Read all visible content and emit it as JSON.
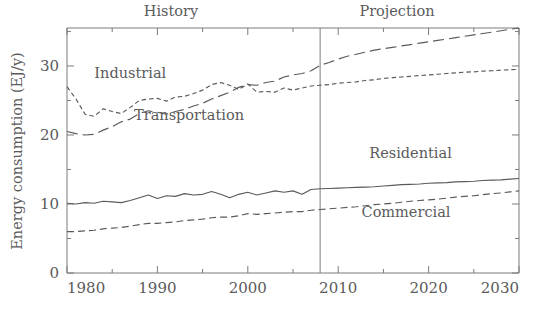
{
  "chart_data": {
    "type": "line",
    "title": "",
    "xlabel": "",
    "ylabel": "Energy consumption (EJ/y)",
    "xlim": [
      1980,
      2030
    ],
    "ylim": [
      0,
      35.5
    ],
    "grid": false,
    "legend_position": "inline-annotations",
    "x_ticks": [
      "1980",
      "1990",
      "2000",
      "2010",
      "2020",
      "2030"
    ],
    "x_tick_values": [
      1980,
      1990,
      2000,
      2010,
      2020,
      2030
    ],
    "x_minor_tick_values": [
      1985,
      1995,
      2005,
      2015,
      2025
    ],
    "y_ticks": [
      "0",
      "10",
      "20",
      "30"
    ],
    "y_tick_values": [
      0,
      10,
      20,
      30
    ],
    "y_minor_tick_values": [
      5,
      15,
      25,
      35
    ],
    "annotations": [
      {
        "text": "History",
        "x": 1991.5,
        "y": 37.3
      },
      {
        "text": "Projection",
        "x": 2016.5,
        "y": 37.3
      },
      {
        "text": "Industrial",
        "x": 1987.0,
        "y": 28.2
      },
      {
        "text": "Transportation",
        "x": 1993.5,
        "y": 22.2
      },
      {
        "text": "Residential",
        "x": 2018.0,
        "y": 16.6
      },
      {
        "text": "Commercial",
        "x": 2017.5,
        "y": 8.1
      }
    ],
    "divider": {
      "label": "history-projection-divider",
      "x": 2008
    },
    "x": [
      1980,
      1981,
      1982,
      1983,
      1984,
      1985,
      1986,
      1987,
      1988,
      1989,
      1990,
      1991,
      1992,
      1993,
      1994,
      1995,
      1996,
      1997,
      1998,
      1999,
      2000,
      2001,
      2002,
      2003,
      2004,
      2005,
      2006,
      2007,
      2008,
      2009,
      2010,
      2011,
      2012,
      2013,
      2014,
      2015,
      2016,
      2017,
      2018,
      2019,
      2020,
      2021,
      2022,
      2023,
      2024,
      2025,
      2026,
      2027,
      2028,
      2029,
      2030
    ],
    "series": [
      {
        "name": "Industrial",
        "line_style": "short-dash",
        "values": [
          27.0,
          25.2,
          23.0,
          22.7,
          23.8,
          23.4,
          23.1,
          24.0,
          25.0,
          25.2,
          25.3,
          24.9,
          25.5,
          25.6,
          26.0,
          26.5,
          27.3,
          27.6,
          27.2,
          26.6,
          27.4,
          26.2,
          26.3,
          26.2,
          26.8,
          26.5,
          26.8,
          27.1,
          27.2,
          27.3,
          27.5,
          27.6,
          27.7,
          27.9,
          28.0,
          28.2,
          28.3,
          28.4,
          28.5,
          28.6,
          28.7,
          28.8,
          28.9,
          29.0,
          29.1,
          29.15,
          29.25,
          29.3,
          29.4,
          29.45,
          29.5
        ]
      },
      {
        "name": "Transportation",
        "line_style": "long-dash",
        "values": [
          20.5,
          20.2,
          20.0,
          20.1,
          20.7,
          21.2,
          21.9,
          22.3,
          23.1,
          23.5,
          23.3,
          23.0,
          23.4,
          23.7,
          24.2,
          24.6,
          25.2,
          25.7,
          26.2,
          26.9,
          27.3,
          27.2,
          27.6,
          27.8,
          28.4,
          28.7,
          28.9,
          29.3,
          30.1,
          30.5,
          31.0,
          31.4,
          31.7,
          32.0,
          32.3,
          32.5,
          32.7,
          32.9,
          33.1,
          33.3,
          33.5,
          33.7,
          33.9,
          34.1,
          34.3,
          34.5,
          34.7,
          34.9,
          35.1,
          35.3,
          35.5
        ]
      },
      {
        "name": "Residential",
        "line_style": "solid",
        "values": [
          10.1,
          10.0,
          10.2,
          10.1,
          10.4,
          10.3,
          10.2,
          10.5,
          10.9,
          11.3,
          10.8,
          11.2,
          11.1,
          11.5,
          11.3,
          11.4,
          11.8,
          11.4,
          10.9,
          11.4,
          11.7,
          11.3,
          11.6,
          11.9,
          11.7,
          11.9,
          11.4,
          12.1,
          12.2,
          12.25,
          12.3,
          12.35,
          12.4,
          12.45,
          12.5,
          12.6,
          12.7,
          12.8,
          12.85,
          12.9,
          13.0,
          13.05,
          13.1,
          13.2,
          13.25,
          13.3,
          13.4,
          13.45,
          13.5,
          13.6,
          13.7
        ]
      },
      {
        "name": "Commercial",
        "line_style": "dash",
        "values": [
          6.0,
          6.0,
          6.1,
          6.2,
          6.4,
          6.5,
          6.6,
          6.8,
          7.0,
          7.2,
          7.2,
          7.3,
          7.4,
          7.6,
          7.7,
          7.8,
          8.0,
          8.1,
          8.1,
          8.3,
          8.6,
          8.5,
          8.6,
          8.7,
          8.8,
          8.9,
          8.9,
          9.1,
          9.2,
          9.3,
          9.4,
          9.5,
          9.6,
          9.75,
          9.9,
          10.0,
          10.1,
          10.25,
          10.4,
          10.5,
          10.6,
          10.7,
          10.85,
          11.0,
          11.1,
          11.2,
          11.35,
          11.5,
          11.6,
          11.75,
          11.9
        ]
      }
    ]
  },
  "ylabel_text": "Energy consumption (EJ/y)"
}
